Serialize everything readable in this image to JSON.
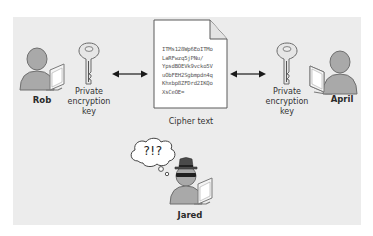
{
  "diagram": {
    "people": {
      "sender": {
        "name": "Rob"
      },
      "receiver": {
        "name": "April"
      },
      "eavesdropper": {
        "name": "Jared",
        "thought": "?!?"
      }
    },
    "keys": {
      "left_label_lines": [
        "Private",
        "encryption",
        "key"
      ],
      "right_label_lines": [
        "Private",
        "encryption",
        "key"
      ]
    },
    "document": {
      "caption": "Cipher text",
      "lines": [
        "ITMs128Wp6EoITMo",
        "LaRFwzq5jPNu/",
        "YpsdBOEVk9vcko5V",
        "uObFEH2Sgbmpdn4q",
        "Khxbp8ZFDrd2IKQo",
        "XsCeOE="
      ]
    },
    "colors": {
      "panel_bg": "#ececec",
      "page_bg": "#ffffff",
      "person_fill": "#a9a9a9",
      "person_stroke": "#6f6f6f",
      "arrow": "#1a1a1a",
      "hat": "#4a4a4a"
    }
  }
}
